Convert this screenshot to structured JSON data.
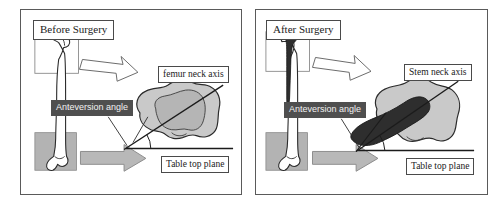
{
  "figure": {
    "caption_present": false,
    "background_color": "#ffffff",
    "panel_border_color": "#5a5a5a"
  },
  "colors": {
    "bone_outline": "#2b2b2b",
    "bone_fill": "#ffffff",
    "condyle_fill": "#c9c9c9",
    "condyle_inner_fill": "#b5b5b5",
    "implant_fill": "#2e2e2e",
    "shaded_box_fill": "#b3b3b3",
    "gray_arrow_fill": "#b8b8b8",
    "white_arrow_fill": "#ffffff",
    "dark_label_bg": "#4f4f4f",
    "dark_label_text": "#f2f2f2",
    "axis_line": "#1b1b1b",
    "table_plane_line": "#1b1b1b"
  },
  "panels": [
    {
      "id": "before",
      "title": "Before Surgery",
      "labels": {
        "axis": "femur neck axis",
        "anteversion": "Anteversion angle",
        "table_plane": "Table top plane"
      },
      "elements": {
        "proximal_box": "outline-only",
        "distal_box": "gray-filled",
        "implant_present": false,
        "arrows": [
          {
            "name": "proximal-view-arrow",
            "style": "white-outline",
            "direction": "down-right"
          },
          {
            "name": "distal-view-arrow",
            "style": "gray-filled",
            "direction": "right"
          }
        ]
      }
    },
    {
      "id": "after",
      "title": "After Surgery",
      "labels": {
        "axis": "Stem neck axis",
        "anteversion": "Anteversion angle",
        "table_plane": "Table top plane"
      },
      "elements": {
        "proximal_box": "outline-only",
        "distal_box": "gray-filled",
        "implant_present": true,
        "arrows": [
          {
            "name": "proximal-view-arrow",
            "style": "white-outline",
            "direction": "down-right"
          },
          {
            "name": "distal-view-arrow",
            "style": "gray-filled",
            "direction": "right"
          }
        ]
      }
    }
  ],
  "scan_artifacts": {
    "faint_text_top_left": "",
    "faint_text_top_right": ""
  }
}
